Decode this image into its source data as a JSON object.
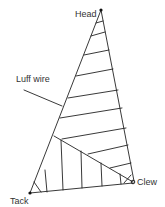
{
  "diagram": {
    "labels": {
      "head": "Head",
      "luff_wire": "Luff wire",
      "clew": "Clew",
      "tack": "Tack"
    },
    "points": {
      "head": [
        101,
        10
      ],
      "tack": [
        30,
        193
      ],
      "clew": [
        133,
        182
      ]
    },
    "colors": {
      "line": "#222222",
      "text": "#333333"
    }
  }
}
